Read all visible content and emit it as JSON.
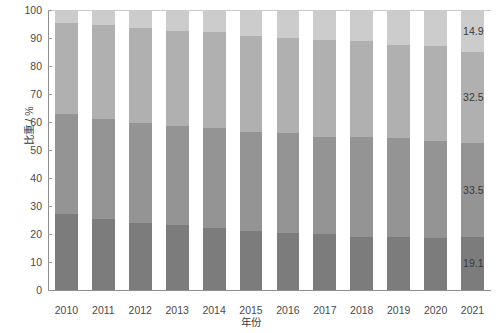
{
  "chart_data": {
    "type": "bar",
    "subtype": "stacked-bar-100",
    "title": "",
    "xlabel": "年份",
    "ylabel": "比重 / %",
    "grid": false,
    "legend": "none",
    "ylim": [
      0,
      100
    ],
    "ytick_labels": [
      "0",
      "10",
      "20",
      "30",
      "40",
      "50",
      "60",
      "70",
      "80",
      "90",
      "100"
    ],
    "ytick_values": [
      0,
      10,
      20,
      30,
      40,
      50,
      60,
      70,
      80,
      90,
      100
    ],
    "categories": [
      "2010",
      "2011",
      "2012",
      "2013",
      "2014",
      "2015",
      "2016",
      "2017",
      "2018",
      "2019",
      "2020",
      "2021"
    ],
    "series": [
      {
        "name": "segment-1-bottom",
        "color": "#7c7c7c",
        "values": [
          27.2,
          25.4,
          24.1,
          23.3,
          22.2,
          21.1,
          20.4,
          20.0,
          19.1,
          18.8,
          18.5,
          19.1
        ]
      },
      {
        "name": "segment-2",
        "color": "#949494",
        "values": [
          35.6,
          35.8,
          35.5,
          35.1,
          35.8,
          35.5,
          35.7,
          34.8,
          35.5,
          35.4,
          34.8,
          33.5
        ]
      },
      {
        "name": "segment-3",
        "color": "#b0b0b0",
        "values": [
          32.7,
          33.4,
          33.8,
          34.0,
          34.2,
          34.1,
          34.0,
          34.6,
          34.3,
          33.2,
          33.9,
          32.5
        ]
      },
      {
        "name": "segment-4-top",
        "color": "#cccccc",
        "values": [
          4.5,
          5.4,
          6.6,
          7.6,
          7.8,
          9.3,
          9.9,
          10.6,
          11.1,
          12.6,
          12.8,
          14.9
        ]
      }
    ],
    "value_labels": {
      "category": "2021",
      "items": [
        {
          "text": "14.9",
          "series": "segment-4-top"
        },
        {
          "text": "32.5",
          "series": "segment-3"
        },
        {
          "text": "33.5",
          "series": "segment-2"
        },
        {
          "text": "19.1",
          "series": "segment-1-bottom"
        }
      ]
    },
    "colors": {
      "axis": "#8e8e8e",
      "tick_text": "#4a4a4a",
      "label_text": "#3a3a3a",
      "background": "#ffffff"
    }
  }
}
